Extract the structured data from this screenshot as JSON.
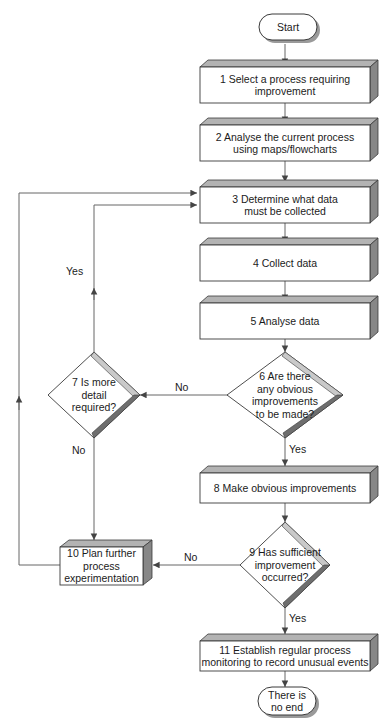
{
  "diagram": {
    "type": "flowchart",
    "canvas": {
      "width": 390,
      "height": 727
    },
    "colors": {
      "outline": "#3a3a3a",
      "face": "#ffffff",
      "top_face": "#b3b3b3",
      "side_face": "#878787",
      "diamond_light_edge": "#c9c9c9",
      "diamond_dark_edge": "#6e6e6e",
      "connector": "#555555",
      "text": "#1b1b1b"
    }
  },
  "nodes": {
    "start": {
      "label": "Start",
      "shape": "terminator"
    },
    "n1": {
      "label": "1 Select a process requiring\nimprovement",
      "shape": "process"
    },
    "n2": {
      "label": "2 Analyse the current process\nusing maps/flowcharts",
      "shape": "process"
    },
    "n3": {
      "label": "3 Determine what data\nmust be collected",
      "shape": "process"
    },
    "n4": {
      "label": "4 Collect data",
      "shape": "process"
    },
    "n5": {
      "label": "5 Analyse data",
      "shape": "process"
    },
    "n6": {
      "label": "6 Are there\nany obvious\nimprovements\nto be made?",
      "shape": "decision"
    },
    "n7": {
      "label": "7 Is more\ndetail\nrequired?",
      "shape": "decision"
    },
    "n8": {
      "label": "8 Make obvious improvements",
      "shape": "process"
    },
    "n9": {
      "label": "9 Has sufficient\nimprovement\noccurred?",
      "shape": "decision"
    },
    "n10": {
      "label": "10 Plan further\nprocess\nexperimentation",
      "shape": "process"
    },
    "n11": {
      "label": "11 Establish regular process\nmonitoring to record unusual events",
      "shape": "process"
    },
    "end": {
      "label": "There is\nno end",
      "shape": "terminator"
    }
  },
  "edge_labels": {
    "six_no": "No",
    "six_yes": "Yes",
    "seven_yes": "Yes",
    "seven_no": "No",
    "nine_no": "No",
    "nine_yes": "Yes"
  },
  "edges": [
    {
      "from": "start",
      "to": "n1",
      "label": ""
    },
    {
      "from": "n1",
      "to": "n2",
      "label": ""
    },
    {
      "from": "n2",
      "to": "n3",
      "label": ""
    },
    {
      "from": "n3",
      "to": "n4",
      "label": ""
    },
    {
      "from": "n4",
      "to": "n5",
      "label": ""
    },
    {
      "from": "n5",
      "to": "n6",
      "label": ""
    },
    {
      "from": "n6",
      "to": "n7",
      "label": "No"
    },
    {
      "from": "n6",
      "to": "n8",
      "label": "Yes"
    },
    {
      "from": "n7",
      "to": "n3",
      "label": "Yes"
    },
    {
      "from": "n7",
      "to": "n10",
      "label": "No"
    },
    {
      "from": "n8",
      "to": "n9",
      "label": ""
    },
    {
      "from": "n9",
      "to": "n10",
      "label": "No"
    },
    {
      "from": "n9",
      "to": "n11",
      "label": "Yes"
    },
    {
      "from": "n10",
      "to": "n3",
      "label": ""
    },
    {
      "from": "n11",
      "to": "end",
      "label": ""
    }
  ]
}
